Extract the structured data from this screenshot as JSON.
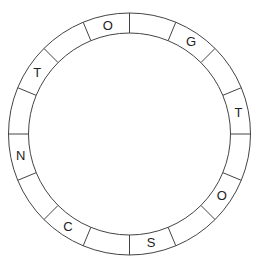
{
  "puzzle": {
    "type": "letter-wheel",
    "segment_count": 16,
    "center": [
      129.5,
      134
    ],
    "outer_radius": 121,
    "inner_radius": 101,
    "stroke_color": "#444444",
    "letter_color": "#222222",
    "segments": [
      {
        "index": 0,
        "letter": ""
      },
      {
        "index": 1,
        "letter": "G"
      },
      {
        "index": 2,
        "letter": ""
      },
      {
        "index": 3,
        "letter": "T"
      },
      {
        "index": 4,
        "letter": ""
      },
      {
        "index": 5,
        "letter": "O"
      },
      {
        "index": 6,
        "letter": ""
      },
      {
        "index": 7,
        "letter": "S"
      },
      {
        "index": 8,
        "letter": ""
      },
      {
        "index": 9,
        "letter": "C"
      },
      {
        "index": 10,
        "letter": ""
      },
      {
        "index": 11,
        "letter": "N"
      },
      {
        "index": 12,
        "letter": ""
      },
      {
        "index": 13,
        "letter": "T"
      },
      {
        "index": 14,
        "letter": ""
      },
      {
        "index": 15,
        "letter": "O"
      }
    ]
  }
}
